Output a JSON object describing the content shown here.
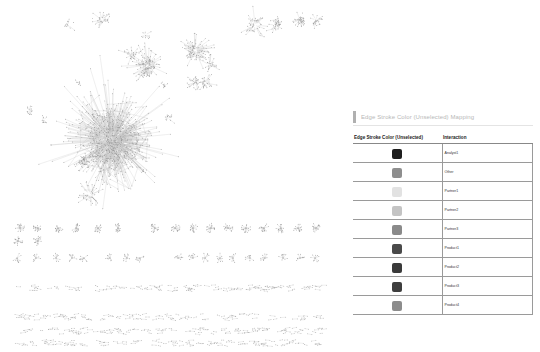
{
  "legend": {
    "title": "Edge Stroke Color (Unselected) Mapping",
    "columns": {
      "color": "Edge Stroke Color (Unselected)",
      "value": "Interaction"
    },
    "rows": [
      {
        "label": "Analyst1",
        "color": "#1e1e1e"
      },
      {
        "label": "Other",
        "color": "#8e8e8e"
      },
      {
        "label": "Partner1",
        "color": "#e2e2e2"
      },
      {
        "label": "Partner2",
        "color": "#c4c4c4"
      },
      {
        "label": "Partner3",
        "color": "#8a8a8a"
      },
      {
        "label": "Product1",
        "color": "#4a4a4a"
      },
      {
        "label": "Product2",
        "color": "#3a3a3a"
      },
      {
        "label": "Product3",
        "color": "#3e3e3e"
      },
      {
        "label": "Product4",
        "color": "#8c8c8c"
      }
    ]
  },
  "network": {
    "node_color": "#8a8a8a",
    "edge_color": "#bdbdbd",
    "clusters": [
      {
        "cx": 112,
        "cy": 140,
        "r": 42,
        "n": 700
      },
      {
        "cx": 85,
        "cy": 160,
        "r": 8,
        "n": 40
      },
      {
        "cx": 90,
        "cy": 195,
        "r": 12,
        "n": 40
      },
      {
        "cx": 148,
        "cy": 65,
        "r": 14,
        "n": 110
      },
      {
        "cx": 132,
        "cy": 55,
        "r": 9,
        "n": 30
      },
      {
        "cx": 195,
        "cy": 50,
        "r": 14,
        "n": 90
      },
      {
        "cx": 210,
        "cy": 65,
        "r": 8,
        "n": 25
      },
      {
        "cx": 195,
        "cy": 82,
        "r": 7,
        "n": 30
      },
      {
        "cx": 205,
        "cy": 83,
        "r": 7,
        "n": 30
      },
      {
        "cx": 255,
        "cy": 25,
        "r": 12,
        "n": 40
      },
      {
        "cx": 275,
        "cy": 25,
        "r": 9,
        "n": 35
      },
      {
        "cx": 300,
        "cy": 20,
        "r": 6,
        "n": 40
      },
      {
        "cx": 316,
        "cy": 20,
        "r": 6,
        "n": 25
      },
      {
        "cx": 102,
        "cy": 20,
        "r": 9,
        "n": 30
      },
      {
        "cx": 68,
        "cy": 25,
        "r": 6,
        "n": 12
      },
      {
        "cx": 30,
        "cy": 112,
        "r": 7,
        "n": 14
      },
      {
        "cx": 44,
        "cy": 120,
        "r": 5,
        "n": 10
      },
      {
        "cx": 168,
        "cy": 118,
        "r": 5,
        "n": 14
      },
      {
        "cx": 164,
        "cy": 86,
        "r": 4,
        "n": 10
      },
      {
        "cx": 78,
        "cy": 83,
        "r": 3,
        "n": 8
      },
      {
        "cx": 145,
        "cy": 35,
        "r": 5,
        "n": 10
      }
    ],
    "small_row_1": {
      "y": 228,
      "xs": [
        20,
        38,
        58,
        76,
        98,
        118,
        155,
        175,
        193,
        211,
        228,
        246,
        264,
        281,
        298,
        316
      ],
      "r": 5,
      "n": 16
    },
    "small_row_1b": {
      "y": 241,
      "xs": [
        18,
        38
      ],
      "r": 5,
      "n": 16
    },
    "small_row_2": {
      "y": 258,
      "xs": [
        17,
        36,
        56,
        72,
        84,
        110,
        127,
        140,
        178,
        193,
        205,
        220,
        233,
        250,
        265,
        283,
        300,
        315
      ],
      "r": 5,
      "n": 9
    },
    "pair_rows": [
      {
        "y": 288,
        "x0": 15,
        "x1": 322,
        "n": 110
      },
      {
        "y": 317,
        "x0": 15,
        "x1": 322,
        "n": 100
      },
      {
        "y": 331,
        "x0": 15,
        "x1": 322,
        "n": 110
      },
      {
        "y": 343,
        "x0": 15,
        "x1": 322,
        "n": 110
      }
    ]
  }
}
